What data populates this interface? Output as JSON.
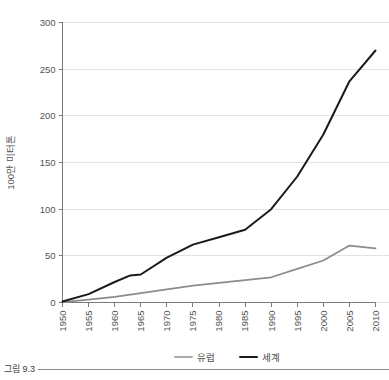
{
  "caption": {
    "label": "그림 9.3"
  },
  "chart_data": {
    "type": "line",
    "title": "",
    "xlabel": "",
    "ylabel": "100만 미터톤",
    "xlim": [
      1950,
      2010
    ],
    "ylim": [
      0,
      300
    ],
    "yticks": [
      0,
      50,
      100,
      150,
      200,
      250,
      300
    ],
    "ytick_labels": [
      "0",
      "50",
      "100",
      "150",
      "200",
      "250",
      "300"
    ],
    "xticks": [
      1950,
      1955,
      1960,
      1965,
      1970,
      1975,
      1980,
      1985,
      1990,
      1995,
      2000,
      2005,
      2010
    ],
    "xtick_labels": [
      "1950",
      "1955",
      "1960",
      "1965",
      "1970",
      "1975",
      "1980",
      "1985",
      "1990",
      "1995",
      "2000",
      "2005",
      "2010"
    ],
    "grid": true,
    "grid_axis": "y",
    "legend_position": "bottom",
    "series": [
      {
        "name": "유럽",
        "color": "#8c8c8c",
        "x": [
          1950,
          1955,
          1960,
          1965,
          1970,
          1975,
          1980,
          1985,
          1990,
          1995,
          2000,
          2005,
          2010
        ],
        "values": [
          0.5,
          3,
          6,
          10,
          14,
          18,
          21,
          24,
          27,
          36,
          45,
          61,
          58
        ]
      },
      {
        "name": "세계",
        "color": "#1a1a1a",
        "x": [
          1950,
          1955,
          1960,
          1963,
          1965,
          1970,
          1975,
          1980,
          1985,
          1990,
          1995,
          2000,
          2005,
          2010
        ],
        "values": [
          1,
          9,
          22,
          29,
          30,
          48,
          62,
          70,
          78,
          100,
          135,
          180,
          237,
          270
        ]
      }
    ]
  }
}
